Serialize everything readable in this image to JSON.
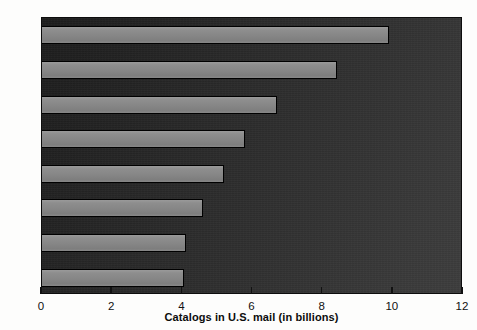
{
  "chart_data": {
    "type": "bar",
    "orientation": "horizontal",
    "title": "",
    "xlabel": "Catalogs in U.S. mail (in billions)",
    "ylabel": "",
    "categories": [
      "1985",
      "1984",
      "1983",
      "1982",
      "1981",
      "1980",
      "1979",
      "1978"
    ],
    "values": [
      9.9,
      8.4,
      6.7,
      5.8,
      5.2,
      4.6,
      4.1,
      4.05
    ],
    "xlim": [
      0,
      12
    ],
    "xticks": [
      0,
      2,
      4,
      6,
      8,
      10,
      12
    ],
    "xtick_labels": [
      "0",
      "2",
      "4",
      "6",
      "8",
      "10",
      "12"
    ],
    "grid": false,
    "legend": false,
    "series": [
      {
        "name": "Catalogs in U.S. mail",
        "values": [
          9.9,
          8.4,
          6.7,
          5.8,
          5.2,
          4.6,
          4.1,
          4.05
        ]
      }
    ],
    "bar_color": "#8a8a8a",
    "bar_border_color": "#000000",
    "plot_background_color": "#2b2b2b",
    "axis_text_color": "#111111"
  },
  "axis": {
    "x_title": "Catalogs in U.S. mail (in billions)"
  }
}
